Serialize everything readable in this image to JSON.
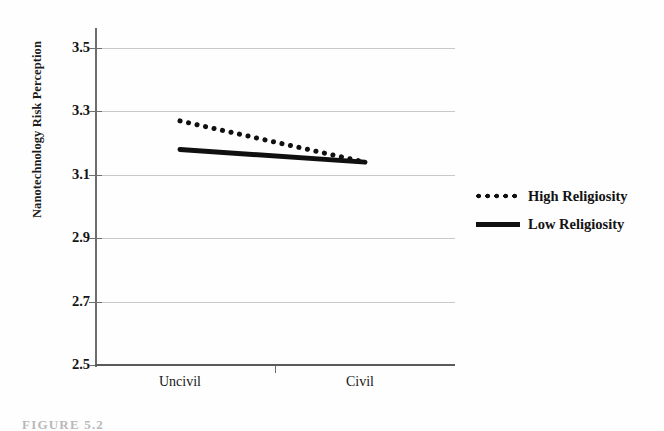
{
  "figure": {
    "caption": "FIGURE 5.2",
    "background_color": "#fefefe",
    "series_color": "#101010",
    "gridline_color": "#c9c9c9",
    "axis_color": "#6d6d6d"
  },
  "axes": {
    "y_title": "Nanotechnology Risk Perception",
    "y_ticks": [
      "3.5",
      "3.3",
      "3.1",
      "2.9",
      "2.7",
      "2.5"
    ],
    "x_ticks": [
      "Uncivil",
      "Civil"
    ]
  },
  "legend": {
    "items": [
      {
        "label": "High Religiosity",
        "style": "dotted"
      },
      {
        "label": "Low Religiosity",
        "style": "solid"
      }
    ]
  },
  "chart_data": {
    "type": "line",
    "title": "",
    "xlabel": "",
    "ylabel": "Nanotechnology Risk Perception",
    "categories": [
      "Uncivil",
      "Civil"
    ],
    "ylim": [
      2.5,
      3.5
    ],
    "ytick_values": [
      3.5,
      3.3,
      3.1,
      2.9,
      2.7,
      2.5
    ],
    "grid": true,
    "legend_position": "right",
    "series": [
      {
        "name": "High Religiosity",
        "style": "dotted",
        "values": [
          3.27,
          3.14
        ]
      },
      {
        "name": "Low Religiosity",
        "style": "solid",
        "values": [
          3.18,
          3.14
        ]
      }
    ]
  }
}
